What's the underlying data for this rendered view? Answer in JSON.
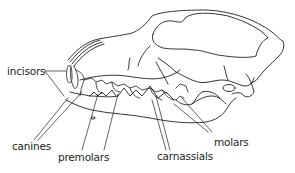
{
  "diagram": {
    "line_color": "#231f20",
    "background": "#ffffff",
    "labels": [
      {
        "id": "incisors",
        "text": "incisors"
      },
      {
        "id": "canines",
        "text": "canines"
      },
      {
        "id": "premolars",
        "text": "premolars"
      },
      {
        "id": "carnassials",
        "text": "carnassials"
      },
      {
        "id": "molars",
        "text": "molars"
      }
    ]
  }
}
